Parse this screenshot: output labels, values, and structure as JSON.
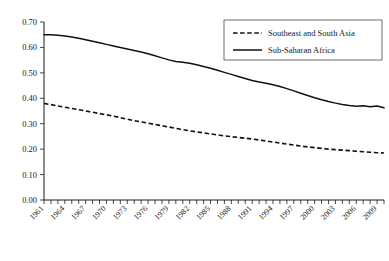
{
  "chart_data": {
    "type": "line",
    "title": "",
    "xlabel": "",
    "ylabel": "",
    "grid": false,
    "legend_position": "top-right",
    "xlim": [
      1961,
      2010
    ],
    "ylim": [
      0.0,
      0.7
    ],
    "ytick_labels": [
      "0.70",
      "0.60",
      "0.50",
      "0.40",
      "0.30",
      "0.20",
      "0.10",
      "0.00"
    ],
    "ytick_values": [
      0.7,
      0.6,
      0.5,
      0.4,
      0.3,
      0.2,
      0.1,
      0.0
    ],
    "xtick_labels": [
      "1961",
      "1964",
      "1967",
      "1970",
      "1973",
      "1976",
      "1979",
      "1982",
      "1985",
      "1988",
      "1991",
      "1994",
      "1997",
      "2000",
      "2003",
      "2006",
      "2009"
    ],
    "xtick_values": [
      1961,
      1964,
      1967,
      1970,
      1973,
      1976,
      1979,
      1982,
      1985,
      1988,
      1991,
      1994,
      1997,
      2000,
      2003,
      2006,
      2009
    ],
    "x": [
      1961,
      1962,
      1963,
      1964,
      1965,
      1966,
      1967,
      1968,
      1969,
      1970,
      1971,
      1972,
      1973,
      1974,
      1975,
      1976,
      1977,
      1978,
      1979,
      1980,
      1981,
      1982,
      1983,
      1984,
      1985,
      1986,
      1987,
      1988,
      1989,
      1990,
      1991,
      1992,
      1993,
      1994,
      1995,
      1996,
      1997,
      1998,
      1999,
      2000,
      2001,
      2002,
      2003,
      2004,
      2005,
      2006,
      2007,
      2008,
      2009,
      2010
    ],
    "series": [
      {
        "name": "Southeast and South Asia",
        "style": "dashed",
        "color": "#111111",
        "values": [
          0.38,
          0.375,
          0.37,
          0.365,
          0.36,
          0.355,
          0.35,
          0.345,
          0.34,
          0.335,
          0.33,
          0.324,
          0.318,
          0.312,
          0.307,
          0.302,
          0.297,
          0.292,
          0.287,
          0.282,
          0.277,
          0.272,
          0.268,
          0.264,
          0.26,
          0.256,
          0.252,
          0.249,
          0.246,
          0.243,
          0.24,
          0.236,
          0.232,
          0.228,
          0.224,
          0.22,
          0.216,
          0.212,
          0.209,
          0.206,
          0.203,
          0.2,
          0.198,
          0.196,
          0.194,
          0.192,
          0.19,
          0.188,
          0.186,
          0.185
        ]
      },
      {
        "name": "Sub-Saharan Africa",
        "style": "solid",
        "color": "#111111",
        "values": [
          0.65,
          0.65,
          0.648,
          0.645,
          0.641,
          0.636,
          0.63,
          0.624,
          0.618,
          0.612,
          0.606,
          0.6,
          0.594,
          0.588,
          0.582,
          0.575,
          0.567,
          0.559,
          0.551,
          0.545,
          0.542,
          0.538,
          0.532,
          0.525,
          0.518,
          0.51,
          0.502,
          0.494,
          0.486,
          0.478,
          0.47,
          0.464,
          0.459,
          0.453,
          0.446,
          0.438,
          0.429,
          0.42,
          0.411,
          0.402,
          0.394,
          0.387,
          0.381,
          0.376,
          0.372,
          0.369,
          0.371,
          0.367,
          0.37,
          0.363
        ]
      }
    ]
  },
  "legend": {
    "entries": [
      {
        "label": "Southeast and South Asia",
        "style": "dashed"
      },
      {
        "label": "Sub-Saharan Africa",
        "style": "solid"
      }
    ]
  }
}
